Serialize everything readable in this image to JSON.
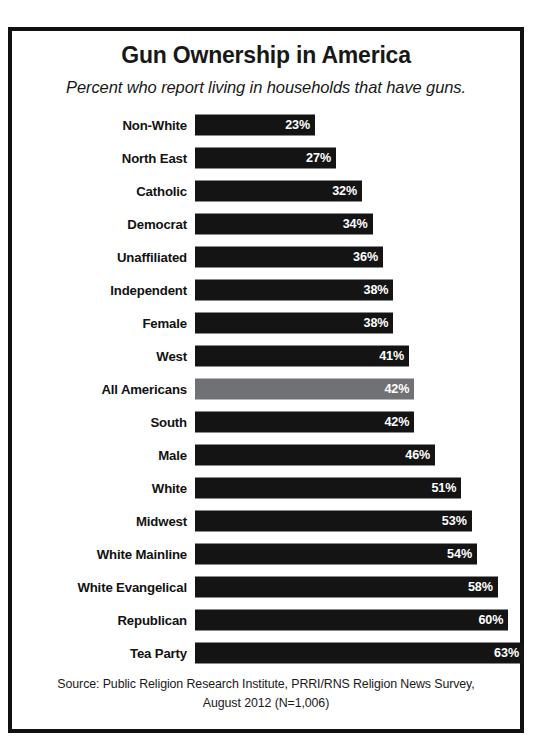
{
  "chart_data": {
    "type": "bar",
    "title": "Gun Ownership in America",
    "subtitle": "Percent who report living in households that have guns.",
    "orientation": "horizontal",
    "xlabel": "",
    "ylabel": "",
    "xlim": [
      0,
      63
    ],
    "grid": false,
    "legend": "none",
    "value_suffix": "%",
    "highlight_category": "All Americans",
    "highlight_color": "#6f7175",
    "bar_color": "#141414",
    "value_label_color": "#ffffff",
    "categories": [
      "Non-White",
      "North East",
      "Catholic",
      "Democrat",
      "Unaffiliated",
      "Independent",
      "Female",
      "West",
      "All Americans",
      "South",
      "Male",
      "White",
      "Midwest",
      "White Mainline",
      "White Evangelical",
      "Republican",
      "Tea Party"
    ],
    "values": [
      23,
      27,
      32,
      34,
      36,
      38,
      38,
      41,
      42,
      42,
      46,
      51,
      53,
      54,
      58,
      60,
      63
    ],
    "value_labels": [
      "23%",
      "27%",
      "32%",
      "34%",
      "36%",
      "38%",
      "38%",
      "41%",
      "42%",
      "42%",
      "46%",
      "51%",
      "53%",
      "54%",
      "58%",
      "60%",
      "63%"
    ],
    "source_line_1": "Source: Public Religion Research Institute, PRRI/RNS Religion News Survey,",
    "source_line_2": "August 2012 (N=1,006)"
  },
  "source": {
    "text": "Source: Public Religion Research Institute, PRRI/RNS Religion News Survey, August 2012 (N=1,006)"
  }
}
